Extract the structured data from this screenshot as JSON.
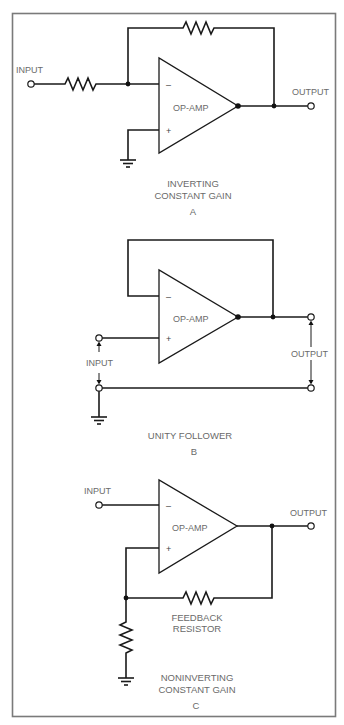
{
  "figure": {
    "circuits": [
      {
        "id": "A",
        "amp_label": "OP-AMP",
        "minus_sign": "–",
        "plus_sign": "+",
        "input_label": "INPUT",
        "output_label": "OUTPUT",
        "caption_line1": "INVERTING",
        "caption_line2": "CONSTANT GAIN",
        "letter": "A"
      },
      {
        "id": "B",
        "amp_label": "OP-AMP",
        "minus_sign": "–",
        "plus_sign": "+",
        "input_label": "INPUT",
        "output_label": "OUTPUT",
        "caption_line1": "UNITY FOLLOWER",
        "letter": "B"
      },
      {
        "id": "C",
        "amp_label": "OP-AMP",
        "minus_sign": "–",
        "plus_sign": "+",
        "input_label": "INPUT",
        "output_label": "OUTPUT",
        "resistor_label_line1": "FEEDBACK",
        "resistor_label_line2": "RESISTOR",
        "caption_line1": "NONINVERTING",
        "caption_line2": "CONSTANT GAIN",
        "letter": "C"
      }
    ]
  }
}
